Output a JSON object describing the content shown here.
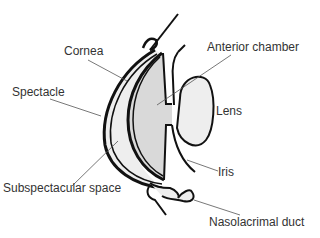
{
  "diagram": {
    "type": "anatomical cross-section",
    "labels": {
      "cornea": "Cornea",
      "spectacle": "Spectacle",
      "subspectacular_space": "Subspectacular space",
      "anterior_chamber": "Anterior chamber",
      "lens": "Lens",
      "iris": "Iris",
      "nasolacrimal_duct": "Nasolacrimal duct"
    },
    "colors": {
      "outline": "#111111",
      "fill_light": "#eeeeee",
      "fill_chamber": "#d9d9d9",
      "leader_line": "#555555",
      "text": "#333333"
    }
  }
}
